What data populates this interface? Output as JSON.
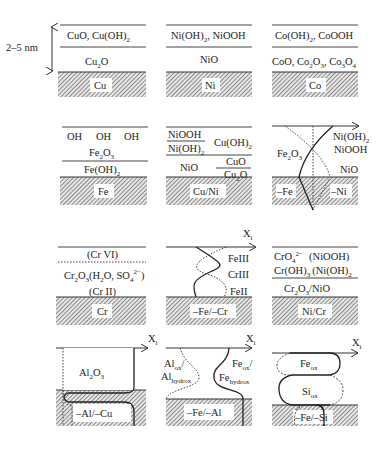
{
  "scale_label": "2–5 nm",
  "axis_label": "X",
  "axis_sub": "i",
  "panels": {
    "cu": {
      "top": "CuO, Cu(OH)",
      "top_sub": "2",
      "mid": "Cu",
      "mid_sub": "2",
      "mid_rest": "O",
      "substrate": "Cu"
    },
    "ni": {
      "top": "Ni(OH)",
      "top_sub": "2",
      "top_rest": ", NiOOH",
      "mid": "NiO",
      "substrate": "Ni"
    },
    "co": {
      "top": "Co(OH)",
      "top_sub": "2",
      "top_rest": ", CoOOH",
      "mid": "CoO, Co",
      "substrate": "Co"
    },
    "fe": {
      "oh1": "OH",
      "oh2": "OH",
      "oh3": "OH",
      "fe2o3": "Fe",
      "feoh2": "Fe(OH)",
      "substrate": "Fe"
    },
    "cuni": {
      "niooh": "NiOOH",
      "nioh2": "Ni(OH)",
      "cuoh2": "Cu(OH)",
      "nio": "NiO",
      "cuo": "CuO",
      "cu2o": "Cu",
      "substrate": "Cu/Ni"
    },
    "feni": {
      "fe2o3": "Fe",
      "nioh2": "Ni(OH)",
      "niooh": "NiOOH",
      "nio": "NiO",
      "sub_fe": "–Fe",
      "sub_ni": "–Ni"
    },
    "cr": {
      "crvi": "(Cr VI)",
      "cr2o3": "Cr",
      "crii": "(Cr II)",
      "substrate": "Cr"
    },
    "fecr": {
      "feiii": "FeIII",
      "criii": "CrIII",
      "feii": "FeII",
      "substrate": "–Fe/–Cr"
    },
    "nicr": {
      "cro4": "CrO",
      "niooh": "(NiOOH)",
      "croh3": "Cr(OH)",
      "nioh2": "(Ni(OH)",
      "cr2o3nio": "Cr",
      "substrate": "Ni/Cr"
    },
    "alcu": {
      "al2o3": "Al",
      "substrate": "–Al/–Cu"
    },
    "feal": {
      "alox": "Al",
      "alox_sub": "ox",
      "alhydrox": "Al",
      "alhydrox_sub": "hydrox",
      "feox": "Fe",
      "feox_sub": "ox",
      "fehydrox": "Fe",
      "fehydrox_sub": "hydrox",
      "substrate": "–Fe/–Al"
    },
    "fesi": {
      "feox": "Fe",
      "feox_sub": "ox",
      "siox": "Si",
      "siox_sub": "ox",
      "substrate": "–Fe/–Si"
    }
  }
}
